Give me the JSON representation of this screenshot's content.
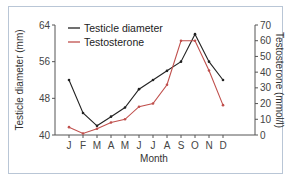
{
  "chart_data": {
    "type": "line",
    "title": "",
    "xlabel": "Month",
    "ylabel": "Testicle diameter (mm)",
    "y2label": "Testosterone (mmol/l)",
    "categories": [
      "J",
      "F",
      "M",
      "A",
      "M",
      "J",
      "J",
      "A",
      "S",
      "O",
      "N",
      "D"
    ],
    "ylim": [
      40,
      64
    ],
    "yticks": [
      40,
      48,
      56,
      64
    ],
    "y2lim": [
      0,
      70
    ],
    "y2ticks": [
      0,
      10,
      20,
      30,
      40,
      50,
      60,
      70
    ],
    "grid": false,
    "legend_position": "upper left",
    "series": [
      {
        "name": "Testicle diameter",
        "axis": "left",
        "color": "#222222",
        "values": [
          52,
          44.8,
          42,
          44,
          46,
          50,
          52,
          54,
          56,
          62,
          56,
          52
        ]
      },
      {
        "name": "Testosterone",
        "axis": "right",
        "color": "#c0504d",
        "values": [
          5,
          1,
          4,
          8,
          10,
          18,
          20,
          32,
          60,
          60,
          41,
          19
        ]
      }
    ]
  },
  "legend": {
    "item1": "Testicle diameter",
    "item2": "Testosterone"
  },
  "axes": {
    "xlabel": "Month",
    "ylabel": "Testicle diameter (mm)",
    "y2label": "Testosterone (mmol/l)"
  }
}
